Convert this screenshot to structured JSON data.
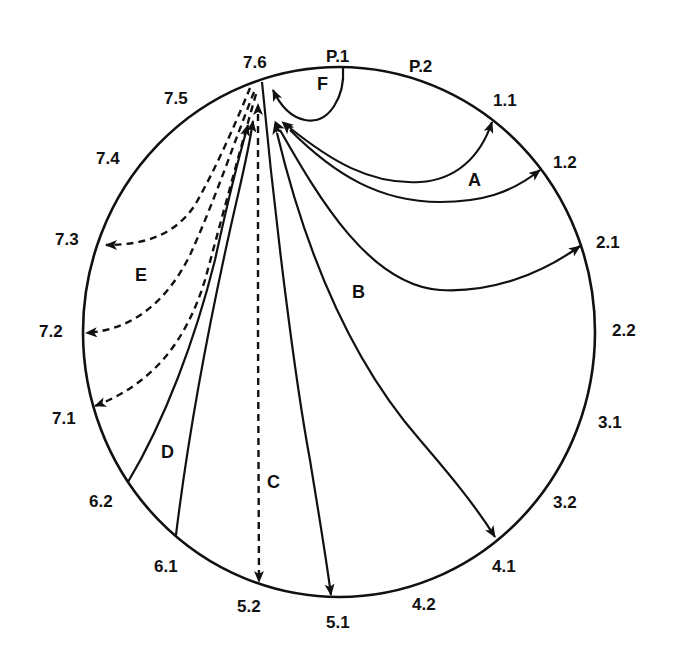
{
  "diagram": {
    "type": "circular-flow",
    "boundary_nodes": [
      {
        "id": "P.1",
        "label": "P.1"
      },
      {
        "id": "P.2",
        "label": "P.2"
      },
      {
        "id": "1.1",
        "label": "1.1"
      },
      {
        "id": "1.2",
        "label": "1.2"
      },
      {
        "id": "2.1",
        "label": "2.1"
      },
      {
        "id": "2.2",
        "label": "2.2"
      },
      {
        "id": "3.1",
        "label": "3.1"
      },
      {
        "id": "3.2",
        "label": "3.2"
      },
      {
        "id": "4.1",
        "label": "4.1"
      },
      {
        "id": "4.2",
        "label": "4.2"
      },
      {
        "id": "5.1",
        "label": "5.1"
      },
      {
        "id": "5.2",
        "label": "5.2"
      },
      {
        "id": "6.1",
        "label": "6.1"
      },
      {
        "id": "6.2",
        "label": "6.2"
      },
      {
        "id": "7.1",
        "label": "7.1"
      },
      {
        "id": "7.2",
        "label": "7.2"
      },
      {
        "id": "7.3",
        "label": "7.3"
      },
      {
        "id": "7.4",
        "label": "7.4"
      },
      {
        "id": "7.5",
        "label": "7.5"
      },
      {
        "id": "7.6",
        "label": "7.6"
      }
    ],
    "groups": [
      {
        "label": "A",
        "style": "solid",
        "edges": [
          {
            "from": "7.6",
            "to": "1.1",
            "bidirectional": true
          },
          {
            "from": "7.6",
            "to": "1.2",
            "bidirectional": true
          }
        ]
      },
      {
        "label": "B",
        "style": "solid",
        "edges": [
          {
            "from": "7.6",
            "to": "2.1",
            "bidirectional": true
          },
          {
            "from": "7.6",
            "to": "4.1",
            "bidirectional": true
          }
        ]
      },
      {
        "label": "C",
        "style": "mixed",
        "edges": [
          {
            "from": "7.6",
            "to": "5.1",
            "style": "solid"
          },
          {
            "from": "7.6",
            "to": "5.2",
            "style": "dashed",
            "bidirectional": true
          }
        ]
      },
      {
        "label": "D",
        "style": "solid",
        "edges": [
          {
            "from": "6.2",
            "to": "7.6"
          },
          {
            "from": "6.1",
            "to": "7.6"
          }
        ]
      },
      {
        "label": "E",
        "style": "dashed",
        "edges": [
          {
            "from": "7.6",
            "to": "7.3"
          },
          {
            "from": "7.6",
            "to": "7.2"
          },
          {
            "from": "7.6",
            "to": "7.1"
          }
        ]
      },
      {
        "label": "F",
        "style": "solid",
        "edges": [
          {
            "from": "P.1",
            "to": "7.6"
          }
        ]
      }
    ]
  }
}
